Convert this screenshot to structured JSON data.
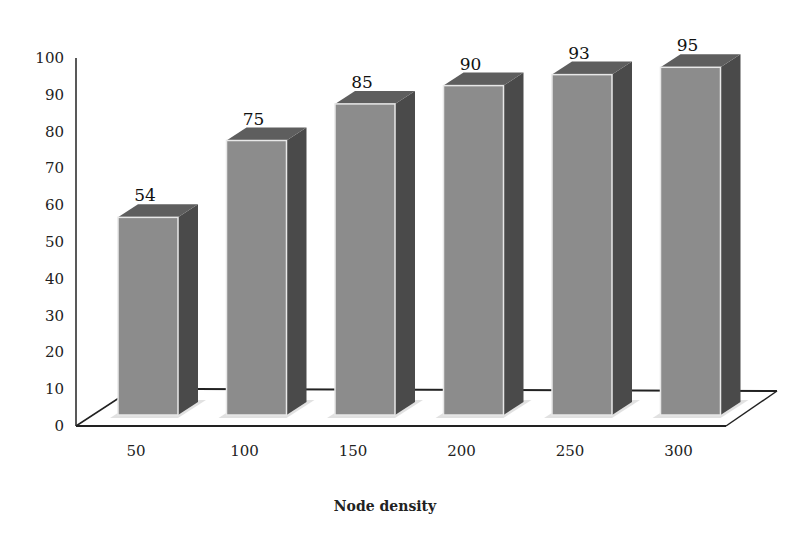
{
  "chart_data": {
    "type": "bar",
    "style": "3d-column",
    "title": "",
    "xlabel": "Node density",
    "ylabel": "",
    "categories": [
      "50",
      "100",
      "150",
      "200",
      "250",
      "300"
    ],
    "values": [
      54,
      75,
      85,
      90,
      93,
      95
    ],
    "data_labels": [
      "54",
      "75",
      "85",
      "90",
      "93",
      "95"
    ],
    "ylim": [
      0,
      100
    ],
    "yticks": [
      "0",
      "10",
      "20",
      "30",
      "40",
      "50",
      "60",
      "70",
      "80",
      "90",
      "100"
    ],
    "grid": false,
    "legend": null,
    "colors": {
      "front": "#8c8c8c",
      "top": "#5e5e5e",
      "side": "#4a4a4a",
      "edge": "#e8e8e8",
      "axis": "#222222"
    }
  }
}
